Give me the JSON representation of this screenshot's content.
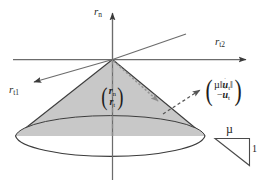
{
  "figure": {
    "background_color": "#ffffff",
    "line_color": "#4a4a4a",
    "cone_fill_color": "#c8c8c8",
    "text_color": "#1d1d1d"
  },
  "axes": [
    {
      "id": "normal-axis",
      "label_base": "r",
      "label_sub": "n",
      "direction": "up",
      "description": "vertical normal force axis"
    },
    {
      "id": "tangential-axis-2",
      "label_base": "r",
      "label_sub": "t2",
      "direction": "right",
      "description": "horizontal tangential axis"
    },
    {
      "id": "tangential-axis-1",
      "label_base": "r",
      "label_sub": "t1",
      "direction": "lower-left",
      "description": "oblique tangential axis"
    }
  ],
  "vectors": {
    "force_vector": {
      "id": "contact-force-vector",
      "row1_base": "r",
      "row1_sub": "n",
      "row2_base": "r",
      "row2_sub": "t",
      "open_paren": "(",
      "close_paren": ")",
      "style": "dotted-arrow"
    },
    "velocity_vector": {
      "id": "sliding-direction-vector",
      "row1": "µ‖u̇‖",
      "row1_mu": "µ",
      "row1_norm_open": "‖",
      "row1_var": "u",
      "row1_sub": "t",
      "row1_norm_close": "‖",
      "row2_minus": "−",
      "row2_var": "u",
      "row2_sub": "t",
      "open_paren": "(",
      "close_paren": ")",
      "style": "dashed-arrow"
    }
  },
  "slope_triangle": {
    "id": "friction-coefficient-triangle",
    "top_label": "µ",
    "side_label": "1",
    "description": "right triangle illustrating slope mu over 1"
  }
}
